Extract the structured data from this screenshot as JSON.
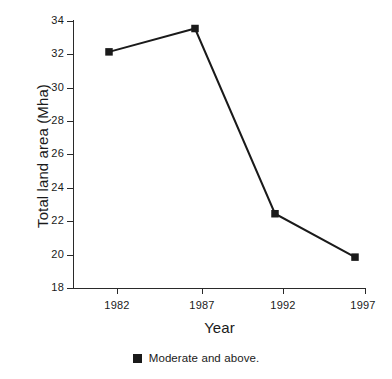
{
  "chart_data": {
    "type": "line",
    "title": "",
    "subtitle": "",
    "xlabel": "Year",
    "ylabel": "Total land area (Mha)",
    "categories": [
      "1982",
      "1987",
      "1992",
      "1997"
    ],
    "x": [
      1982,
      1987,
      1992,
      1997
    ],
    "series": [
      {
        "name": "Moderate and above.",
        "values": [
          32.15,
          33.55,
          22.45,
          19.85
        ],
        "color": "#1a1a1a",
        "marker": "filled-square"
      }
    ],
    "xlim": [
      1980.5,
      1998.0
    ],
    "ylim": [
      18,
      34
    ],
    "y_ticks": [
      18,
      20,
      22,
      24,
      26,
      28,
      30,
      32,
      34
    ],
    "x_ticks": [
      "1982",
      "1987",
      "1992",
      "1997"
    ],
    "grid": false,
    "legend_position": "bottom-center",
    "legend_entries": [
      "Moderate and above."
    ]
  },
  "axes": {
    "y_title": "Total land area (Mha)",
    "x_title": "Year",
    "y_tick_labels": [
      "34",
      "32",
      "30",
      "28",
      "26",
      "24",
      "22",
      "20",
      "18"
    ],
    "x_tick_labels": [
      "1982",
      "1987",
      "1992",
      "1997"
    ]
  },
  "legend": {
    "swatch_name": "filled-square-marker",
    "label": "Moderate and above."
  },
  "colors": {
    "background": "#ffffff",
    "foreground": "#1a1a1a",
    "axis": "#2a2a2a",
    "series": "#1a1a1a"
  }
}
